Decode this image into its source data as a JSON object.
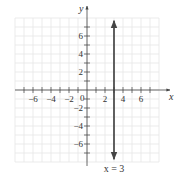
{
  "chart_data": {
    "type": "line",
    "title": "",
    "xlabel": "x",
    "ylabel": "y",
    "xlim": [
      -8,
      8
    ],
    "ylim": [
      -8,
      8
    ],
    "grid": true,
    "x_ticks": [
      -6,
      -4,
      -2,
      2,
      4,
      6
    ],
    "y_ticks": [
      -6,
      -4,
      -2,
      2,
      4,
      6
    ],
    "x_tick_labels": [
      "−6",
      "−4",
      "−2",
      "2",
      "4",
      "6"
    ],
    "y_tick_labels": [
      "−6",
      "−4",
      "−2",
      "2",
      "4",
      "6"
    ],
    "origin_label": "0",
    "series": [
      {
        "name": "x = 3",
        "kind": "vertical_line",
        "x": 3,
        "y_range": [
          -7.7,
          7.7
        ],
        "arrows": "both",
        "color": "#3a3a3a"
      }
    ],
    "annotations": [
      {
        "text": "x = 3",
        "x": 3,
        "y": -9.1
      }
    ]
  },
  "colors": {
    "axis": "#444444",
    "grid": "#e6e6e6",
    "line": "#3a3a3a",
    "text": "#333333"
  }
}
